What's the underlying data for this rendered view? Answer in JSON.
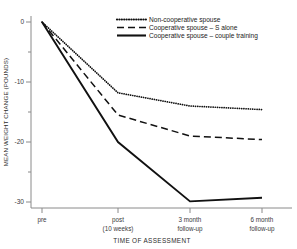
{
  "chart_data": {
    "type": "line",
    "title": "",
    "xlabel": "TIME OF ASSESSMENT",
    "ylabel": "MEAN WEIGHT CHANGE (POUNDS)",
    "categories": [
      "pre",
      "post (10 weeks)",
      "3 month follow-up",
      "6 month follow-up"
    ],
    "x_tick_labels": [
      {
        "line1": "pre",
        "line2": ""
      },
      {
        "line1": "post",
        "line2": "(10 weeks)"
      },
      {
        "line1": "3 month",
        "line2": "follow-up"
      },
      {
        "line1": "6 month",
        "line2": "follow-up"
      }
    ],
    "y_tick_labels": [
      "0",
      "-10",
      "-20",
      "-30"
    ],
    "y_tick_values": [
      0,
      -10,
      -20,
      -30
    ],
    "y_minor_tick_values": [
      -5,
      -15,
      -25
    ],
    "ylim": [
      -32,
      1
    ],
    "grid": false,
    "legend_position": "top-right",
    "series": [
      {
        "name": "Non-cooperative spouse",
        "style": "dotted",
        "color": "#111111",
        "values": [
          0,
          -11.8,
          -14.0,
          -14.6
        ]
      },
      {
        "name": "Cooperative spouse – S alone",
        "style": "dashed",
        "color": "#111111",
        "values": [
          0,
          -15.5,
          -19.0,
          -19.6
        ]
      },
      {
        "name": "Cooperative spouse – couple training",
        "style": "solid",
        "color": "#111111",
        "values": [
          0,
          -20.0,
          -29.9,
          -29.3
        ]
      }
    ]
  },
  "legend": {
    "items": [
      {
        "label": "Non-cooperative spouse",
        "style": "dotted"
      },
      {
        "label": "Cooperative spouse – S alone",
        "style": "dashed"
      },
      {
        "label": "Cooperative spouse – couple training",
        "style": "solid"
      }
    ]
  },
  "axes": {
    "y_title": "MEAN WEIGHT CHANGE (POUNDS)",
    "x_title": "TIME OF ASSESSMENT"
  }
}
